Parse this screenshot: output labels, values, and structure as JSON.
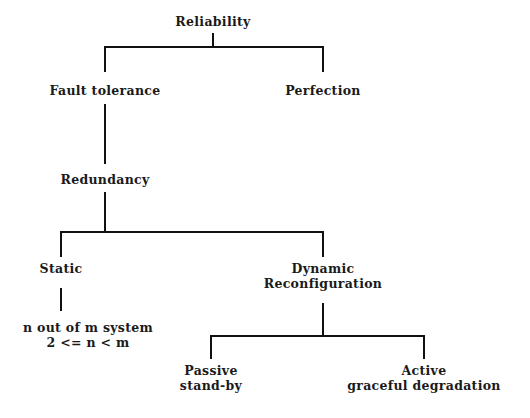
{
  "diagram": {
    "line_color": "#111111",
    "text_color": "#1a1a1a",
    "background": "#ffffff",
    "nodes": {
      "root": {
        "label": "Reliability"
      },
      "fault_tolerance": {
        "label": "Fault tolerance"
      },
      "perfection": {
        "label": "Perfection"
      },
      "redundancy": {
        "label": "Redundancy"
      },
      "static": {
        "label": "Static"
      },
      "dynamic": {
        "label_line1": "Dynamic",
        "label_line2": "Reconfiguration"
      },
      "n_out_of_m": {
        "label_line1": "n out of m system",
        "label_line2": "2 <= n < m"
      },
      "passive": {
        "label_line1": "Passive",
        "label_line2": "stand-by"
      },
      "active": {
        "label_line1": "Active",
        "label_line2": "graceful degradation"
      }
    }
  }
}
